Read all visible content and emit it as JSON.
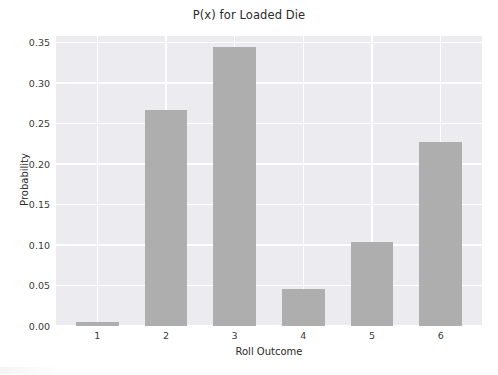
{
  "chart_data": {
    "type": "bar",
    "title": "P(x) for Loaded Die",
    "xlabel": "Roll Outcome",
    "ylabel": "Probability",
    "categories": [
      "1",
      "2",
      "3",
      "4",
      "5",
      "6"
    ],
    "values": [
      0.005,
      0.267,
      0.344,
      0.046,
      0.104,
      0.227
    ],
    "ylim": [
      0.0,
      0.358
    ],
    "xlim": [
      0.4,
      6.6
    ],
    "ytick_labels": [
      "0.00",
      "0.05",
      "0.10",
      "0.15",
      "0.20",
      "0.25",
      "0.30",
      "0.35"
    ],
    "ytick_values": [
      0.0,
      0.05,
      0.1,
      0.15,
      0.2,
      0.25,
      0.3,
      0.35
    ],
    "xtick_labels": [
      "1",
      "2",
      "3",
      "4",
      "5",
      "6"
    ],
    "grid": true,
    "legend": "none",
    "bar_color": "#aeaeae",
    "plot_background": "#ebebf0",
    "grid_color": "#ffffff",
    "figure_background": "#ffffff"
  }
}
